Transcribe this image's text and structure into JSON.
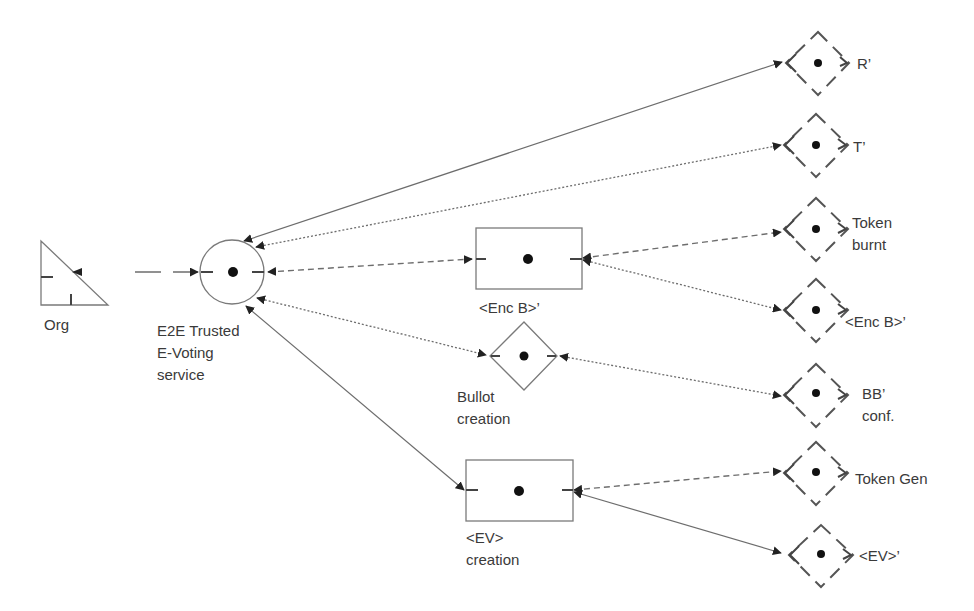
{
  "diagram": {
    "nodes": {
      "org": {
        "label": "Org",
        "shape": "triangle"
      },
      "service": {
        "label_lines": [
          "E2E Trusted",
          "E-Voting",
          "service"
        ],
        "shape": "circle"
      },
      "enc_b": {
        "label": "<Enc B>’",
        "shape": "rectangle"
      },
      "bullot": {
        "label_lines": [
          "Bullot",
          "creation"
        ],
        "shape": "diamond"
      },
      "ev_creation": {
        "label_lines": [
          "<EV>",
          "creation"
        ],
        "shape": "rectangle"
      },
      "r_prime": {
        "label": "R’",
        "shape": "dashed-diamond"
      },
      "t_prime": {
        "label": "T’",
        "shape": "dashed-diamond"
      },
      "token_burnt": {
        "label_lines": [
          "Token",
          "burnt"
        ],
        "shape": "dashed-diamond"
      },
      "enc_b_prime": {
        "label": "<Enc B>’",
        "shape": "dashed-diamond"
      },
      "bb_conf": {
        "label_lines": [
          "BB’",
          "conf."
        ],
        "shape": "dashed-diamond"
      },
      "token_gen": {
        "label": "Token Gen",
        "shape": "dashed-diamond"
      },
      "ev_prime": {
        "label": "<EV>’",
        "shape": "dashed-diamond"
      }
    },
    "edges": [
      {
        "from": "org",
        "to": "service",
        "style": "long-dash"
      },
      {
        "from": "service",
        "to": "r_prime",
        "style": "solid",
        "bidirectional": true
      },
      {
        "from": "service",
        "to": "t_prime",
        "style": "dotted",
        "bidirectional": true
      },
      {
        "from": "service",
        "to": "enc_b",
        "style": "dashed",
        "bidirectional": true
      },
      {
        "from": "service",
        "to": "bullot",
        "style": "dotted",
        "bidirectional": true
      },
      {
        "from": "service",
        "to": "ev_creation",
        "style": "solid",
        "bidirectional": true
      },
      {
        "from": "enc_b",
        "to": "token_burnt",
        "style": "dashed",
        "bidirectional": true
      },
      {
        "from": "enc_b",
        "to": "enc_b_prime",
        "style": "dotted",
        "bidirectional": true
      },
      {
        "from": "bullot",
        "to": "bb_conf",
        "style": "dotted",
        "bidirectional": true
      },
      {
        "from": "ev_creation",
        "to": "token_gen",
        "style": "dashed",
        "bidirectional": true
      },
      {
        "from": "ev_creation",
        "to": "ev_prime",
        "style": "solid",
        "bidirectional": true
      }
    ]
  }
}
